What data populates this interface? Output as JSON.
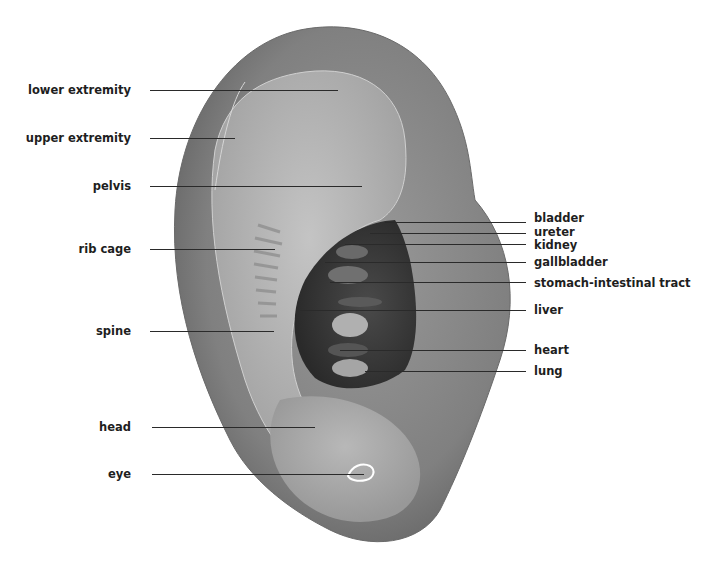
{
  "diagram": {
    "left_labels": [
      {
        "text": "lower extremity",
        "y": 90,
        "line_end_x": 338
      },
      {
        "text": "upper extremity",
        "y": 138,
        "line_end_x": 235
      },
      {
        "text": "pelvis",
        "y": 186,
        "line_end_x": 362
      },
      {
        "text": "rib cage",
        "y": 249,
        "line_end_x": 275
      },
      {
        "text": "spine",
        "y": 331,
        "line_end_x": 274
      },
      {
        "text": "head",
        "y": 427,
        "line_end_x": 315
      },
      {
        "text": "eye",
        "y": 474,
        "line_end_x": 364
      }
    ],
    "right_labels": [
      {
        "text": "bladder",
        "y": 222,
        "line_start_x": 385
      },
      {
        "text": "ureter",
        "y": 233,
        "line_start_x": 370
      },
      {
        "text": "kidney",
        "y": 244,
        "line_start_x": 345
      },
      {
        "text": "gallbladder",
        "y": 262,
        "line_start_x": 325
      },
      {
        "text": "stomach-intestinal tract",
        "y": 282,
        "line_start_x": 330
      },
      {
        "text": "liver",
        "y": 310,
        "line_start_x": 300
      },
      {
        "text": "heart",
        "y": 350,
        "line_start_x": 340
      },
      {
        "text": "lung",
        "y": 371,
        "line_start_x": 365
      }
    ],
    "colors": {
      "background": "#ffffff",
      "label_text": "#1e1e1e",
      "leader_line": "#2a2a2a",
      "ear_outer": "#7d7d7d",
      "ear_inner": "#a8a8a8",
      "concha_dark": "#3a3a3a",
      "eye_outline": "#ffffff"
    }
  }
}
